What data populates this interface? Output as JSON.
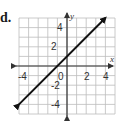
{
  "problem": {
    "label": "d."
  },
  "chart_data": {
    "type": "line",
    "title": "",
    "xlabel": "x",
    "ylabel": "y",
    "xlim": [
      -5,
      5
    ],
    "ylim": [
      -5,
      5
    ],
    "grid": true,
    "x_ticks": [
      "-4",
      "0",
      "2",
      "4"
    ],
    "y_ticks": [
      "4",
      "2",
      "-2",
      "-4"
    ],
    "series": [
      {
        "name": "line",
        "equation": "y = x + 1",
        "x": [
          -5,
          4
        ],
        "y": [
          -4,
          5
        ],
        "arrows": "both"
      }
    ],
    "colors": {
      "grid": "#bdbdbd",
      "axis": "#333333",
      "line": "#111111"
    }
  }
}
